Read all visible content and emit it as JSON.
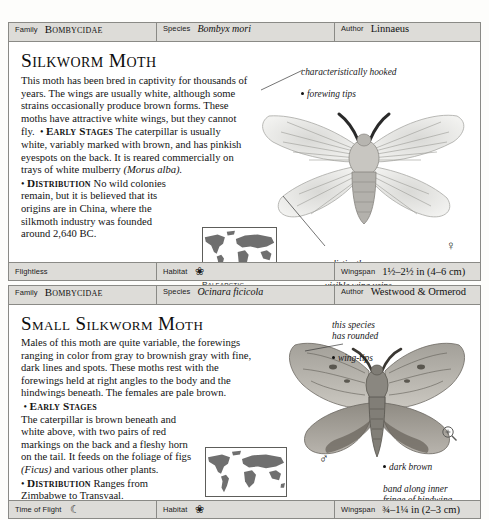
{
  "page": {
    "labels": {
      "family": "Family",
      "species": "Species",
      "author": "Author",
      "habitat": "Habitat",
      "wingspan": "Wingspan",
      "time_of_flight": "Time of Flight",
      "flightless": "Flightless"
    }
  },
  "entries": [
    {
      "header": {
        "family": "Bombycidae",
        "species": "Bombyx mori",
        "author": "Linnaeus"
      },
      "title": "Silkworm Moth",
      "description": "This moth has been bred in captivity for thousands of years. The wings are usually white, although some strains occasionally produce brown forms. These moths have attractive white wings, but they cannot fly.",
      "early_stages_label": "Early Stages",
      "early_stages": "The caterpillar is usually white, variably marked with brown, and has pinkish eyespots on the back. It is reared commercially on trays of white mulberry",
      "early_stages_italic": "(Morus alba).",
      "distribution_label": "Distribution",
      "distribution": "No wild colonies remain, but it is believed that its origins are in China, where the silkmoth industry was founded around 2,640 BC.",
      "map_caption": "Palearctic",
      "annotations": [
        {
          "text": "characteristically hooked",
          "text2": "forewing tips",
          "name": "annotation-forewing-tips"
        },
        {
          "text": "distinctly",
          "text2": "visible wing veins",
          "name": "annotation-wing-veins"
        }
      ],
      "sex_symbol": "♀",
      "footer": {
        "col1_label": "Flightless",
        "col1_value": "",
        "col2_label": "Habitat",
        "col2_icon": "leaf-sprig-icon",
        "col3_label": "Wingspan",
        "col3_value": "1½–2½ in (4–6 cm)"
      }
    },
    {
      "header": {
        "family": "Bombycidae",
        "species": "Ocinara ficicola",
        "author": "Westwood & Ormerod"
      },
      "title": "Small Silkworm Moth",
      "description": "Males of this moth are quite variable, the forewings ranging in color from gray to brownish gray with fine, dark lines and spots. These moths rest with the forewings held at right angles to the body and the hindwings beneath. The females are pale brown.",
      "early_stages_label": "Early Stages",
      "early_stages": "The caterpillar is brown beneath and white above, with two pairs of red markings on the back and a fleshy horn on the tail. It feeds on the foliage of figs",
      "early_stages_italic": "(Ficus)",
      "early_stages_tail": "and various other plants.",
      "distribution_label": "Distribution",
      "distribution": "Ranges from Zimbabwe to Transvaal.",
      "map_caption": "Afrotropical",
      "annotations": [
        {
          "text": "this species\nhas rounded",
          "text2": "wing-tips",
          "name": "annotation-wing-tips"
        },
        {
          "text": "dark brown",
          "text2": "band along inner\nfringe of hindwing",
          "name": "annotation-hindwing-band"
        }
      ],
      "sex_symbol": "♂",
      "footer": {
        "col1_label": "Time of Flight",
        "col1_icon": "crescent-moon-icon",
        "col2_label": "Habitat",
        "col2_icon": "leaf-sprig-icon",
        "col3_label": "Wingspan",
        "col3_value": "¾–1¼ in (2–3 cm)"
      }
    }
  ],
  "colors": {
    "header_bg": "#dddcd8",
    "border": "#8a8a86",
    "text": "#121212",
    "map_land": "#6f6f6f"
  }
}
